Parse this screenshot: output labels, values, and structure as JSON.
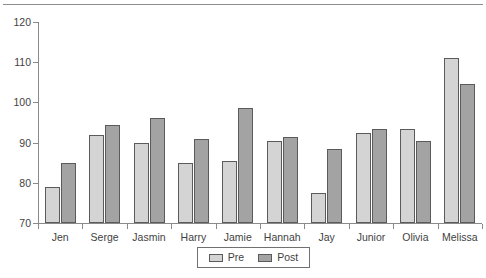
{
  "chart_data": {
    "type": "bar",
    "title": "",
    "subtitle": "",
    "xlabel": "",
    "ylabel": "",
    "ylim": [
      70,
      120
    ],
    "y_ticks": [
      70,
      80,
      90,
      100,
      110,
      120
    ],
    "grid": false,
    "legend_position": "bottom",
    "categories": [
      "Jen",
      "Serge",
      "Jasmin",
      "Harry",
      "Jamie",
      "Hannah",
      "Jay",
      "Junior",
      "Olivia",
      "Melissa"
    ],
    "series": [
      {
        "name": "Pre",
        "color": "#d4d4d4",
        "values": [
          79,
          92,
          90,
          85,
          85.5,
          90.5,
          77.5,
          92.5,
          93.5,
          111
        ]
      },
      {
        "name": "Post",
        "color": "#a3a3a3",
        "values": [
          85,
          94.5,
          96,
          91,
          98.5,
          91.5,
          88.5,
          93.5,
          90.5,
          104.5
        ]
      }
    ]
  },
  "legend": {
    "entries": [
      {
        "label": "Pre"
      },
      {
        "label": "Post"
      }
    ]
  },
  "colors": {
    "pre": "#d4d4d4",
    "post": "#a3a3a3",
    "axis": "#8a8a8a",
    "bar_outline": "#5b5b5b",
    "text": "#3f3f3f"
  }
}
